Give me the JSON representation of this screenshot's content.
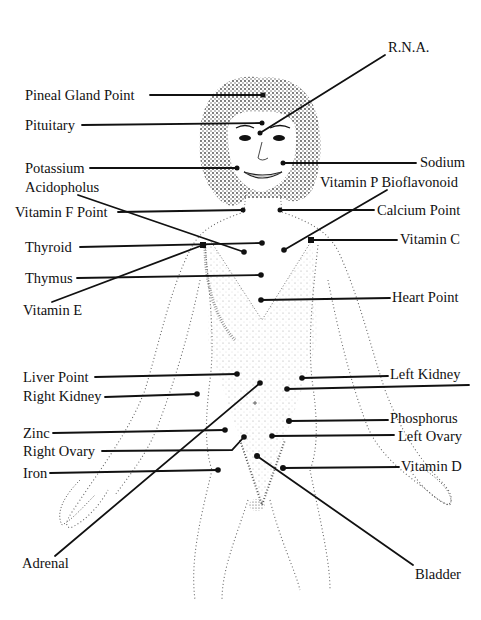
{
  "diagram": {
    "title": "",
    "figure": "woman-body-outline",
    "labels": {
      "rna": "R.N.A.",
      "pineal": "Pineal Gland Point",
      "pituitary": "Pituitary",
      "potassium": "Potassium",
      "sodium": "Sodium",
      "acidopholus": "Acidopholus",
      "vitamin_p": "Vitamin P Bioflavonoid",
      "vitamin_f": "Vitamin F Point",
      "calcium": "Calcium Point",
      "thyroid": "Thyroid",
      "vitamin_c": "Vitamin C",
      "thymus": "Thymus",
      "vitamin_e": "Vitamin E",
      "heart": "Heart Point",
      "liver": "Liver Point",
      "left_kidney": "Left Kidney",
      "right_kidney": "Right Kidney",
      "phosphorus": "Phosphorus",
      "zinc": "Zinc",
      "left_ovary": "Left Ovary",
      "right_ovary": "Right Ovary",
      "iron": "Iron",
      "vitamin_d": "Vitamin D",
      "adrenal": "Adrenal",
      "bladder": "Bladder"
    },
    "colors": {
      "ink": "#111111",
      "stipple": "#555555",
      "background": "#ffffff"
    }
  }
}
